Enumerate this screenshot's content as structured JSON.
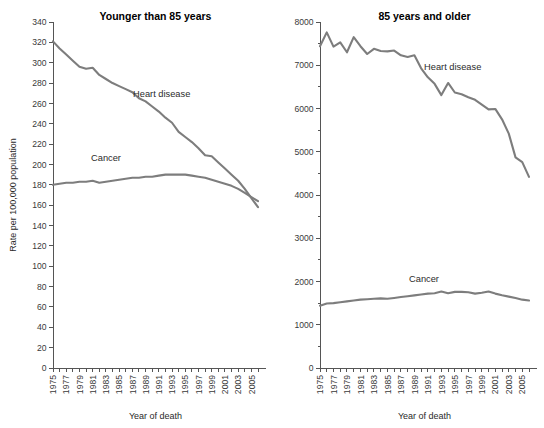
{
  "figure": {
    "background_color": "#ffffff",
    "line_color": "#7d7d7d",
    "axis_color": "#555555"
  },
  "panels": {
    "left": {
      "title": "Younger than 85 years",
      "xlabel": "Year of death",
      "ylabel": "Rate per 100,000 population",
      "series_labels": {
        "heart": "Heart disease",
        "cancer": "Cancer"
      }
    },
    "right": {
      "title": "85 years and older",
      "xlabel": "Year of death",
      "ylabel": "",
      "series_labels": {
        "heart": "Heart disease",
        "cancer": "Cancer"
      }
    }
  },
  "chart_data": [
    {
      "type": "line",
      "title": "Younger than 85 years",
      "xlabel": "Year of death",
      "ylabel": "Rate per 100,000 population",
      "xlim": [
        1975,
        2006
      ],
      "ylim": [
        0,
        340
      ],
      "ytick_labels": [
        "0",
        "20",
        "40",
        "60",
        "80",
        "100",
        "120",
        "140",
        "160",
        "180",
        "200",
        "220",
        "240",
        "260",
        "280",
        "300",
        "320",
        "340"
      ],
      "ytick_values": [
        0,
        20,
        40,
        60,
        80,
        100,
        120,
        140,
        160,
        180,
        200,
        220,
        240,
        260,
        280,
        300,
        320,
        340
      ],
      "xtick_labels": [
        "1975",
        "1977",
        "1979",
        "1981",
        "1983",
        "1985",
        "1987",
        "1989",
        "1991",
        "1993",
        "1995",
        "1997",
        "1999",
        "2001",
        "2003",
        "2005"
      ],
      "xtick_values": [
        1975,
        1977,
        1979,
        1981,
        1983,
        1985,
        1987,
        1989,
        1991,
        1993,
        1995,
        1997,
        1999,
        2001,
        2003,
        2005
      ],
      "minor_xticks_every": 1,
      "grid": false,
      "legend_position": "inline-annotation",
      "x": [
        1975,
        1976,
        1977,
        1978,
        1979,
        1980,
        1981,
        1982,
        1983,
        1984,
        1985,
        1986,
        1987,
        1988,
        1989,
        1990,
        1991,
        1992,
        1993,
        1994,
        1995,
        1996,
        1997,
        1998,
        1999,
        2000,
        2001,
        2002,
        2003,
        2004,
        2005,
        2006
      ],
      "series": [
        {
          "name": "Heart disease",
          "values": [
            321,
            314,
            308,
            302,
            296,
            294,
            295,
            288,
            284,
            280,
            277,
            274,
            271,
            265,
            262,
            257,
            252,
            246,
            241,
            232,
            227,
            222,
            216,
            209,
            208,
            202,
            196,
            190,
            184,
            176,
            167,
            158
          ]
        },
        {
          "name": "Cancer",
          "values": [
            180,
            181,
            182,
            182,
            183,
            183,
            184,
            182,
            183,
            184,
            185,
            186,
            187,
            187,
            188,
            188,
            189,
            190,
            190,
            190,
            190,
            189,
            188,
            187,
            185,
            183,
            181,
            179,
            176,
            172,
            168,
            164
          ]
        }
      ]
    },
    {
      "type": "line",
      "title": "85 years and older",
      "xlabel": "Year of death",
      "ylabel": "",
      "xlim": [
        1975,
        2006
      ],
      "ylim": [
        0,
        8000
      ],
      "ytick_labels": [
        "0",
        "1000",
        "2000",
        "3000",
        "4000",
        "5000",
        "6000",
        "7000",
        "8000"
      ],
      "ytick_values": [
        0,
        1000,
        2000,
        3000,
        4000,
        5000,
        6000,
        7000,
        8000
      ],
      "minor_ytick_step": 500,
      "xtick_labels": [
        "1975",
        "1977",
        "1979",
        "1981",
        "1983",
        "1985",
        "1987",
        "1989",
        "1991",
        "1993",
        "1995",
        "1997",
        "1999",
        "2001",
        "2003",
        "2005"
      ],
      "xtick_values": [
        1975,
        1977,
        1979,
        1981,
        1983,
        1985,
        1987,
        1989,
        1991,
        1993,
        1995,
        1997,
        1999,
        2001,
        2003,
        2005
      ],
      "minor_xticks_every": 1,
      "grid": false,
      "legend_position": "inline-annotation",
      "x": [
        1975,
        1976,
        1977,
        1978,
        1979,
        1980,
        1981,
        1982,
        1983,
        1984,
        1985,
        1986,
        1987,
        1988,
        1989,
        1990,
        1991,
        1992,
        1993,
        1994,
        1995,
        1996,
        1997,
        1998,
        1999,
        2000,
        2001,
        2002,
        2003,
        2004,
        2005,
        2006
      ],
      "series": [
        {
          "name": "Heart disease",
          "values": [
            7440,
            7760,
            7430,
            7530,
            7300,
            7650,
            7440,
            7260,
            7380,
            7330,
            7320,
            7340,
            7230,
            7190,
            7230,
            6930,
            6720,
            6570,
            6310,
            6590,
            6370,
            6330,
            6260,
            6200,
            6090,
            5980,
            5990,
            5750,
            5420,
            4870,
            4760,
            4420
          ]
        },
        {
          "name": "Cancer",
          "values": [
            1440,
            1490,
            1500,
            1520,
            1540,
            1560,
            1580,
            1590,
            1600,
            1610,
            1600,
            1620,
            1640,
            1660,
            1680,
            1700,
            1720,
            1730,
            1770,
            1730,
            1760,
            1760,
            1750,
            1720,
            1740,
            1770,
            1720,
            1680,
            1650,
            1620,
            1580,
            1560
          ]
        }
      ]
    }
  ]
}
